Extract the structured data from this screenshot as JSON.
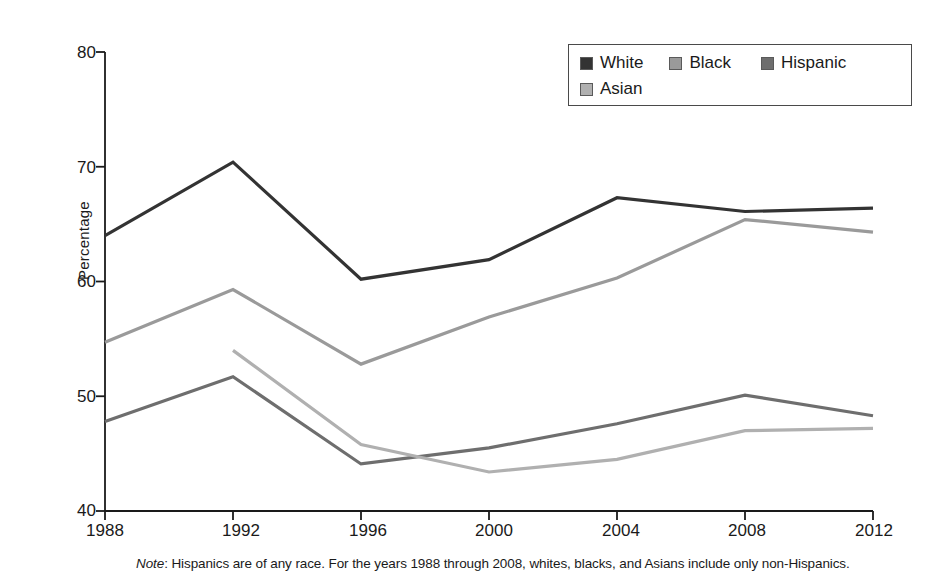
{
  "figure": {
    "note_label": "Note",
    "note_text": ": Hispanics are of any race. For the years 1988 through 2008, whites, blacks, and Asians include only non-Hispanics."
  },
  "axes": {
    "ylabel": "Percentage",
    "yticks": [
      "40",
      "50",
      "60",
      "70",
      "80"
    ],
    "xticks": [
      "1988",
      "1992",
      "1996",
      "2000",
      "2004",
      "2008",
      "2012"
    ]
  },
  "legend": {
    "entries": [
      {
        "label": "White",
        "color": "#333333"
      },
      {
        "label": "Black",
        "color": "#9a9a9a"
      },
      {
        "label": "Hispanic",
        "color": "#6e6e6e"
      },
      {
        "label": "Asian",
        "color": "#b0b0b0"
      }
    ]
  },
  "chart_data": {
    "type": "line",
    "title": "",
    "xlabel": "",
    "ylabel": "Percentage",
    "x": [
      1988,
      1992,
      1996,
      2000,
      2004,
      2008,
      2012
    ],
    "xlim": [
      1988,
      2012
    ],
    "ylim": [
      40,
      80
    ],
    "yticks": [
      40,
      50,
      60,
      70,
      80
    ],
    "grid": false,
    "legend_position": "upper-right",
    "series": [
      {
        "name": "White",
        "color": "#333333",
        "values": [
          64.0,
          70.4,
          60.2,
          61.9,
          67.3,
          66.1,
          66.4
        ]
      },
      {
        "name": "Black",
        "color": "#9a9a9a",
        "values": [
          54.7,
          59.3,
          52.8,
          56.9,
          60.3,
          65.4,
          64.3
        ]
      },
      {
        "name": "Hispanic",
        "color": "#6e6e6e",
        "values": [
          47.8,
          51.7,
          44.1,
          45.5,
          47.6,
          50.1,
          48.3
        ]
      },
      {
        "name": "Asian",
        "color": "#b0b0b0",
        "values": [
          null,
          54.0,
          45.8,
          43.4,
          44.5,
          47.0,
          47.2
        ]
      }
    ],
    "annotations": [
      "Note: Hispanics are of any race. For the years 1988 through 2008, whites, blacks, and Asians include only non-Hispanics."
    ]
  }
}
